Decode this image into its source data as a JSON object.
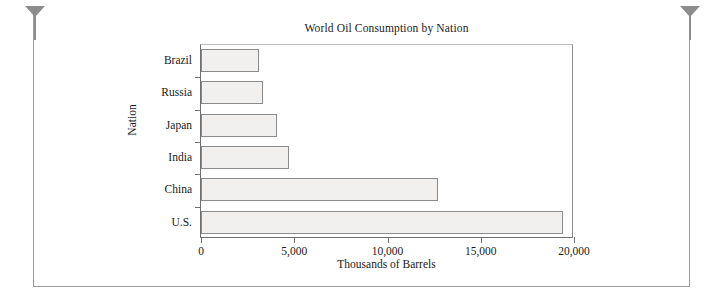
{
  "frame": {
    "pin_left_name": "page-pin-left",
    "pin_right_name": "page-pin-right"
  },
  "chart_data": {
    "type": "bar",
    "orientation": "horizontal",
    "title": "World Oil Consumption by Nation",
    "xlabel": "Thousands of Barrels",
    "ylabel": "Nation",
    "categories": [
      "Brazil",
      "Russia",
      "Japan",
      "India",
      "China",
      "U.S."
    ],
    "values": [
      3100,
      3300,
      4100,
      4700,
      12700,
      19400
    ],
    "series": [
      {
        "name": "Thousands of Barrels",
        "values": [
          3100,
          3300,
          4100,
          4700,
          12700,
          19400
        ]
      }
    ],
    "xlim": [
      0,
      20000
    ],
    "xticks": [
      0,
      5000,
      10000,
      15000,
      20000
    ],
    "xtick_labels": [
      "0",
      "5,000",
      "10,000",
      "15,000",
      "20,000"
    ],
    "grid": false,
    "legend": false,
    "bar_fill_color": "#f1f0ee",
    "bar_edge_color": "#8b8b8b",
    "axis_color": "#6f6f6f"
  }
}
